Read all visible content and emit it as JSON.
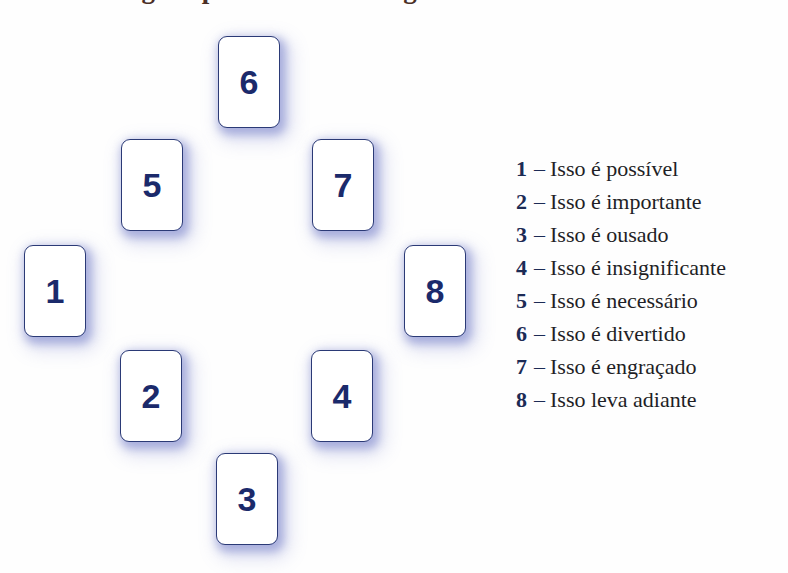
{
  "title": {
    "text": "guas para lidar com algumas coisas ao lado"
  },
  "background_color": "#fefefe",
  "colors": {
    "card_border": "#2b3a76",
    "card_fill": "#ffffff",
    "card_number": "#1b2a6b",
    "card_glow": "#5c68be",
    "legend_number": "#1c2b55",
    "legend_label": "#1f1f26",
    "title": "#4a2f26"
  },
  "cards": [
    {
      "number": "6",
      "x": 218,
      "y": 36,
      "position": "top"
    },
    {
      "number": "5",
      "x": 121,
      "y": 139,
      "position": "upper-left"
    },
    {
      "number": "7",
      "x": 312,
      "y": 139,
      "position": "upper-right"
    },
    {
      "number": "1",
      "x": 24,
      "y": 245,
      "position": "left"
    },
    {
      "number": "8",
      "x": 404,
      "y": 245,
      "position": "right"
    },
    {
      "number": "2",
      "x": 120,
      "y": 350,
      "position": "lower-left"
    },
    {
      "number": "4",
      "x": 311,
      "y": 350,
      "position": "lower-right"
    },
    {
      "number": "3",
      "x": 216,
      "y": 453,
      "position": "bottom"
    }
  ],
  "legend": {
    "separator": "–",
    "items": [
      {
        "number": "1",
        "label": "Isso é possível"
      },
      {
        "number": "2",
        "label": "Isso é importante"
      },
      {
        "number": "3",
        "label": "Isso é ousado"
      },
      {
        "number": "4",
        "label": "Isso é insignificante"
      },
      {
        "number": "5",
        "label": "Isso é necessário"
      },
      {
        "number": "6",
        "label": "Isso é divertido"
      },
      {
        "number": "7",
        "label": "Isso é engraçado"
      },
      {
        "number": "8",
        "label": "Isso leva adiante"
      }
    ]
  }
}
